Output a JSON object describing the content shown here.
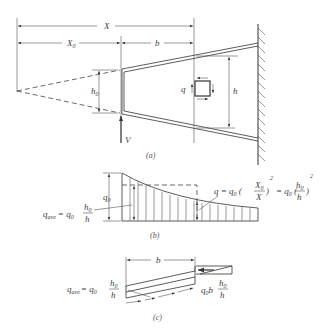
{
  "figure": {
    "part_a": {
      "caption": "(a)",
      "labels": {
        "X": "X",
        "X0": "X",
        "X0_sub": "0",
        "b": "b",
        "h0": "h",
        "h0_sub": "0",
        "h": "h",
        "q": "q",
        "V": "V"
      }
    },
    "part_b": {
      "caption": "(b)",
      "labels": {
        "q0": "q",
        "q0_sub": "0",
        "qave_left": "q",
        "qave_sub": "ave",
        "qave_eq": "= q",
        "qave_eq_sub": "0",
        "frac_num": "h",
        "frac_num_sub": "0",
        "frac_den": "h",
        "formula_q": "q = q",
        "formula_q_sub": "0",
        "formula_paren1_num": "X",
        "formula_paren1_num_sub": "0",
        "formula_paren1_den": "X",
        "formula_exp1": "2",
        "formula_eq2": "= q",
        "formula_eq2_sub": "0",
        "formula_paren2_num": "h",
        "formula_paren2_num_sub": "0",
        "formula_paren2_den": "h",
        "formula_exp2": "2"
      }
    },
    "part_c": {
      "caption": "(c)",
      "labels": {
        "b": "b",
        "qave": "q",
        "qave_sub": "ave",
        "qave_eq": "= q",
        "qave_eq_sub": "0",
        "frac_num": "h",
        "frac_num_sub": "0",
        "frac_den": "h",
        "right_q0b": "q",
        "right_q0b_sub": "0",
        "right_b": "b",
        "right_frac_num": "h",
        "right_frac_num_sub": "0",
        "right_frac_den": "h"
      }
    }
  }
}
